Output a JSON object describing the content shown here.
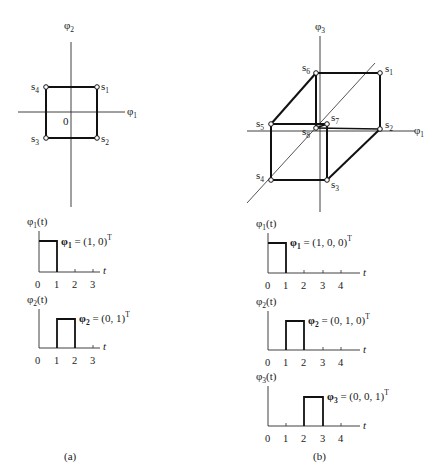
{
  "panel_a": {
    "caption": "(a)",
    "signal_space": {
      "axis_labels": {
        "vertical": "φ",
        "vertical_sub": "2",
        "horizontal": "φ",
        "horizontal_sub": "1",
        "origin": "0"
      },
      "points": [
        {
          "name": "s",
          "sub": "1",
          "coords": [
            1,
            1
          ]
        },
        {
          "name": "s",
          "sub": "2",
          "coords": [
            1,
            -1
          ]
        },
        {
          "name": "s",
          "sub": "3",
          "coords": [
            -1,
            -1
          ]
        },
        {
          "name": "s",
          "sub": "4",
          "coords": [
            -1,
            1
          ]
        }
      ]
    },
    "waveforms": [
      {
        "ylabel": "φ",
        "ylabel_sub": "1",
        "ylabel_arg": "(t)",
        "vector_label": "φ",
        "vector_sub": "1",
        "vector_value": " = (1, 0)",
        "vector_sup": "T",
        "pulse": [
          0,
          1
        ],
        "xlabel": "t",
        "ticks": [
          "0",
          "1",
          "2",
          "3"
        ]
      },
      {
        "ylabel": "φ",
        "ylabel_sub": "2",
        "ylabel_arg": "(t)",
        "vector_label": "φ",
        "vector_sub": "2",
        "vector_value": " = (0, 1)",
        "vector_sup": "T",
        "pulse": [
          1,
          2
        ],
        "xlabel": "t",
        "ticks": [
          "0",
          "1",
          "2",
          "3"
        ]
      }
    ]
  },
  "panel_b": {
    "caption": "(b)",
    "signal_space": {
      "axis_labels": {
        "vertical": "φ",
        "vertical_sub": "3",
        "horizontal": "φ",
        "horizontal_sub": "1"
      },
      "points": [
        {
          "name": "s",
          "sub": "1"
        },
        {
          "name": "s",
          "sub": "2"
        },
        {
          "name": "s",
          "sub": "3"
        },
        {
          "name": "s",
          "sub": "4"
        },
        {
          "name": "s",
          "sub": "5"
        },
        {
          "name": "s",
          "sub": "6"
        },
        {
          "name": "s",
          "sub": "7"
        },
        {
          "name": "s",
          "sub": "8"
        }
      ]
    },
    "waveforms": [
      {
        "ylabel": "φ",
        "ylabel_sub": "1",
        "ylabel_arg": "(t)",
        "vector_label": "φ",
        "vector_sub": "1",
        "vector_value": " = (1, 0, 0)",
        "vector_sup": "T",
        "pulse": [
          0,
          1
        ],
        "xlabel": "t",
        "ticks": [
          "0",
          "1",
          "2",
          "3",
          "4"
        ]
      },
      {
        "ylabel": "φ",
        "ylabel_sub": "2",
        "ylabel_arg": "(t)",
        "vector_label": "φ",
        "vector_sub": "2",
        "vector_value": " = (0, 1, 0)",
        "vector_sup": "T",
        "pulse": [
          1,
          2
        ],
        "xlabel": "t",
        "ticks": [
          "0",
          "1",
          "2",
          "3",
          "4"
        ]
      },
      {
        "ylabel": "φ",
        "ylabel_sub": "3",
        "ylabel_arg": "(t)",
        "vector_label": "φ",
        "vector_sub": "3",
        "vector_value": " = (0, 0, 1)",
        "vector_sup": "T",
        "pulse": [
          2,
          3
        ],
        "xlabel": "t",
        "ticks": [
          "0",
          "1",
          "2",
          "3",
          "4"
        ]
      }
    ]
  }
}
